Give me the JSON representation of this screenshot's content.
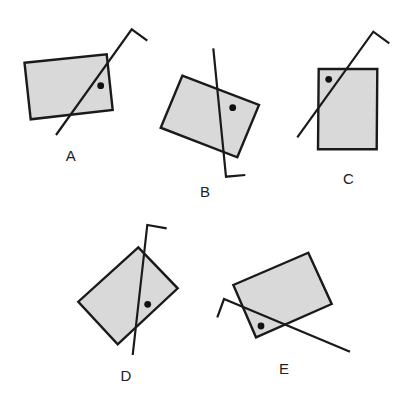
{
  "figure": {
    "colors": {
      "rectangle_fill": "#d9d9d9",
      "stroke": "#1a1a1a",
      "dot": "#111111",
      "background": "#ffffff"
    },
    "options": [
      {
        "id": "A",
        "label": "A"
      },
      {
        "id": "B",
        "label": "B"
      },
      {
        "id": "C",
        "label": "C"
      },
      {
        "id": "D",
        "label": "D"
      },
      {
        "id": "E",
        "label": "E"
      }
    ]
  }
}
